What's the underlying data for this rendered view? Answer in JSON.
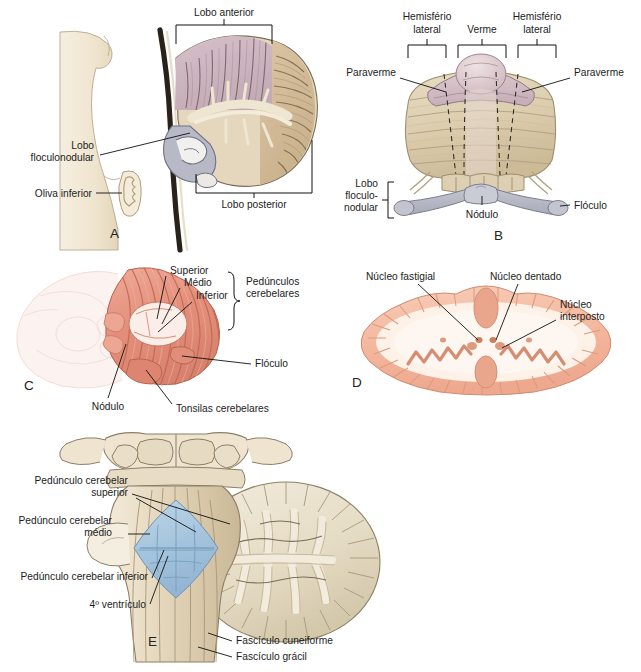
{
  "figure": {
    "background": "#ffffff",
    "label_color": "#1c1c1c"
  },
  "palette": {
    "cream": "#efe6d4",
    "cream_light": "#f6efe1",
    "tan": "#d8c4a4",
    "tan_dark": "#c2a983",
    "mauve": "#d3bcc4",
    "mauve_dark": "#bda2ad",
    "gray_blue": "#b9bcc7",
    "gray_blue_dark": "#9ba0ae",
    "salmon": "#e8917f",
    "salmon_light": "#f3bdb0",
    "salmon_pale": "#f7dcd6",
    "pink_pale": "#fbe3de",
    "peach": "#f7c4ae",
    "peach_mid": "#f0ad95",
    "ventricle_blue": "#a9c6dd",
    "ventricle_blue_dark": "#8fb2cd",
    "stem_dark": "#2a2118",
    "outline": "#8a7c68"
  },
  "panels": [
    {
      "id": "A",
      "letter": "A",
      "caption": "Corte sagital — lobos do cerebelo",
      "labels": [
        {
          "key": "lobo_anterior",
          "text": "Lobo anterior",
          "type": "bracket-label"
        },
        {
          "key": "lobo_posterior",
          "text": "Lobo posterior",
          "type": "bracket-label"
        },
        {
          "key": "lobo_floculonodular",
          "text": "Lobo",
          "text2": "floculonodular",
          "type": "leader-label"
        },
        {
          "key": "oliva_inferior",
          "text": "Oliva inferior",
          "type": "leader-label"
        }
      ]
    },
    {
      "id": "B",
      "letter": "B",
      "caption": "Vista posterior — verme e hemisférios",
      "labels": [
        {
          "key": "hemisferio_lateral_esq",
          "text": "Hemisfério",
          "text2": "lateral",
          "type": "bracket-label"
        },
        {
          "key": "verme",
          "text": "Verme",
          "type": "bracket-label"
        },
        {
          "key": "hemisferio_lateral_dir",
          "text": "Hemisfério",
          "text2": "lateral",
          "type": "bracket-label"
        },
        {
          "key": "paraverme_esq",
          "text": "Paraverme",
          "type": "leader-label"
        },
        {
          "key": "paraverme_dir",
          "text": "Paraverme",
          "type": "leader-label"
        },
        {
          "key": "lobo_floculonodular",
          "text": "Lobo",
          "text2": "floculo-",
          "text3": "nodular",
          "type": "bracket-label"
        },
        {
          "key": "nodulo",
          "text": "Nódulo",
          "type": "leader-label"
        },
        {
          "key": "floculo",
          "text": "Flóculo",
          "type": "leader-label"
        }
      ]
    },
    {
      "id": "C",
      "letter": "C",
      "caption": "Vista lateral — pedúnculos cerebelares",
      "labels": [
        {
          "key": "superior",
          "text": "Superior",
          "type": "leader-label"
        },
        {
          "key": "medio",
          "text": "Médio",
          "type": "leader-label"
        },
        {
          "key": "inferior",
          "text": "Inferior",
          "type": "leader-label"
        },
        {
          "key": "pedunculos",
          "text": "Pedúnculos",
          "text2": "cerebelares",
          "type": "brace-label"
        },
        {
          "key": "floculo",
          "text": "Flóculo",
          "type": "leader-label"
        },
        {
          "key": "nodulo",
          "text": "Nódulo",
          "type": "leader-label"
        },
        {
          "key": "tonsilas",
          "text": "Tonsilas cerebelares",
          "type": "leader-label"
        }
      ]
    },
    {
      "id": "D",
      "letter": "D",
      "caption": "Corte horizontal — núcleos cerebelares",
      "labels": [
        {
          "key": "nucleo_fastigial",
          "text": "Núcleo fastigial",
          "type": "leader-label"
        },
        {
          "key": "nucleo_dentado",
          "text": "Núcleo dentado",
          "type": "leader-label"
        },
        {
          "key": "nucleo_interposto",
          "text": "Núcleo",
          "text2": "interposto",
          "type": "leader-label"
        }
      ]
    },
    {
      "id": "E",
      "letter": "E",
      "caption": "Tronco encefálico e pedúnculos cerebelares",
      "labels": [
        {
          "key": "ped_superior",
          "text": "Pedúnculo cerebelar",
          "text2": "superior",
          "type": "leader-label"
        },
        {
          "key": "ped_medio",
          "text": "Pedúnculo cerebelar",
          "text2": "médio",
          "type": "leader-label"
        },
        {
          "key": "ped_inferior",
          "text": "Pedúnculo cerebelar inferior",
          "type": "leader-label"
        },
        {
          "key": "ventriculo",
          "text": "4º ventrículo",
          "type": "leader-label"
        },
        {
          "key": "fasc_cuneiforme",
          "text": "Fascículo cuneiforme",
          "type": "leader-label"
        },
        {
          "key": "fasc_gracil",
          "text": "Fascículo grácil",
          "type": "leader-label"
        }
      ]
    }
  ]
}
